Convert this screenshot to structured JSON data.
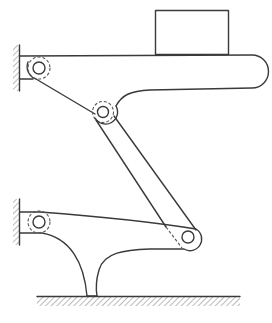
{
  "diagram": {
    "type": "mechanism-schematic",
    "colors": {
      "line": "#3a3a3a",
      "background": "#ffffff",
      "hatch": "#555555"
    },
    "components": [
      {
        "id": "top-wall",
        "kind": "fixed-support"
      },
      {
        "id": "bottom-wall",
        "kind": "fixed-support"
      },
      {
        "id": "ground",
        "kind": "fixed-ground"
      },
      {
        "id": "top-pivot",
        "kind": "pin-joint"
      },
      {
        "id": "middle-pivot",
        "kind": "pin-joint"
      },
      {
        "id": "bottom-pivot",
        "kind": "pin-joint"
      },
      {
        "id": "right-pivot",
        "kind": "pin-joint"
      },
      {
        "id": "platform",
        "kind": "link"
      },
      {
        "id": "connecting-link",
        "kind": "link"
      },
      {
        "id": "lower-lever",
        "kind": "link"
      },
      {
        "id": "payload-box",
        "kind": "body"
      }
    ]
  }
}
